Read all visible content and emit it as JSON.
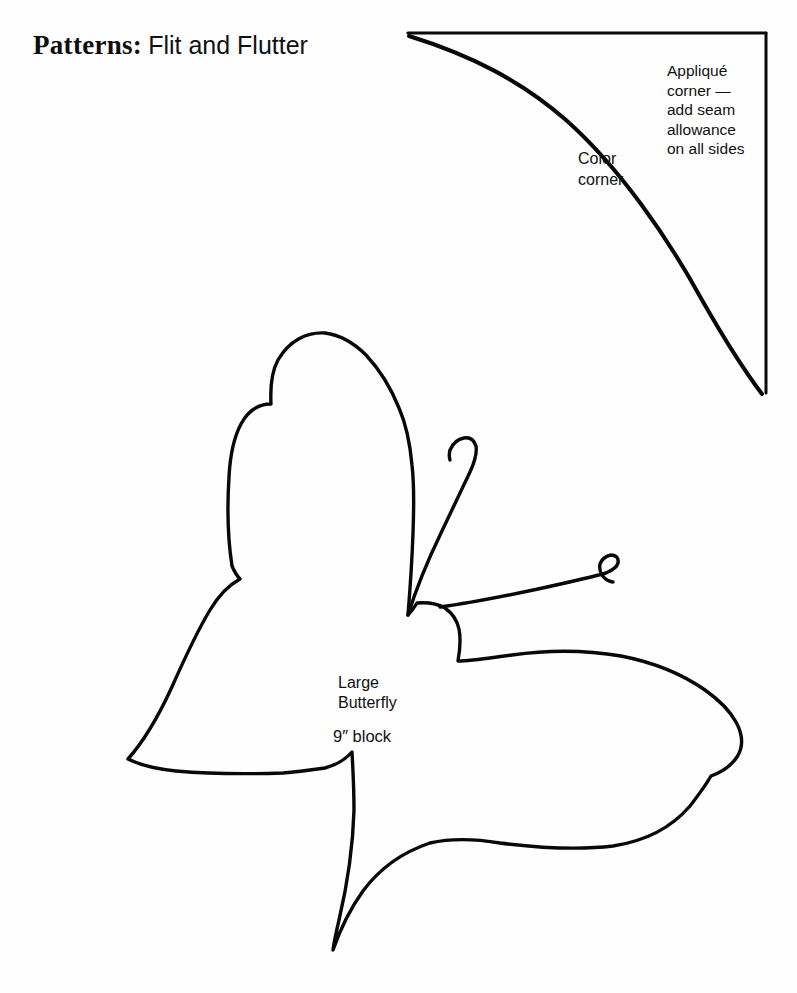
{
  "page": {
    "width": 797,
    "height": 993,
    "background_color": "#fefefe",
    "ink_color": "#080808"
  },
  "header": {
    "title_serif": "Patterns:",
    "title_sans": "Flit and Flutter"
  },
  "annotations": {
    "applique_corner": {
      "line1": "Appliqué",
      "line2": "corner —",
      "line3": "add seam",
      "line4": "allowance",
      "line5": "on all sides"
    },
    "color_corner": {
      "line1": "Color",
      "line2": "corner"
    },
    "butterfly_label": {
      "line1": "Large",
      "line2": "Butterfly",
      "size": "9″ block"
    }
  },
  "shapes": {
    "corner_template": {
      "name": "applique-corner-template",
      "top_edge": "M 408 33 L 766 33",
      "right_edge": "M 766 33 L 766 393",
      "curve": "M 409 36 C 470 55 520 80 566 120 C 620 168 668 238 702 300 C 726 342 746 373 762 394"
    },
    "butterfly": {
      "name": "large-butterfly-outline",
      "body_outline": "M 325 333 C 306 332 289 341 278 360 C 272 371 270 385 271 404 C 258 404 248 411 241 424 C 233 439 230 457 229 477 C 227 508 228 540 232 566 C 235 573 237 576 240 579 C 229 585 219 595 210 610 C 196 633 183 662 171 689 C 158 717 144 741 128 759 C 140 765 156 769 176 771 C 210 774 252 774 283 773 C 297 772 311 770 325 768 C 336 765 345 760 352 752 C 353 770 354 790 354 810 C 353 846 347 886 339 920 C 336 933 334 943 333 950 C 340 930 350 909 363 891 C 380 868 403 852 430 843 C 452 838 476 839 500 843 C 540 848 580 850 613 846 C 646 841 672 827 690 806 C 700 793 707 783 711 776 C 722 772 731 766 737 757 C 744 746 742 733 736 722 C 730 711 719 700 705 690 C 682 674 652 662 621 656 C 586 650 547 650 512 655 C 489 658 471 661 458 661 C 460 650 461 639 459 629 C 457 620 452 613 445 608 C 438 604 428 602 417 603 C 414 608 411 612 408 615 C 410 590 412 562 413 533 C 414 506 414 482 412 465 C 410 443 406 424 399 408 C 391 388 380 370 366 355 C 354 343 340 335 325 333 Z",
      "antenna_left": "M 408 615 C 416 589 428 560 441 533 C 452 510 462 489 470 472 C 475 461 477 452 476 446 C 474 440 470 437 464 438 C 458 439 453 443 450 450 C 449 454 449 457 450 460",
      "antenna_right": "M 440 607 C 470 603 505 596 538 589 C 570 582 596 576 606 573 C 613 570 617 567 618 563 C 619 558 616 555 611 555 C 606 556 602 559 600 564 C 599 570 601 576 607 580 C 609 581 611 582 613 582"
    }
  }
}
